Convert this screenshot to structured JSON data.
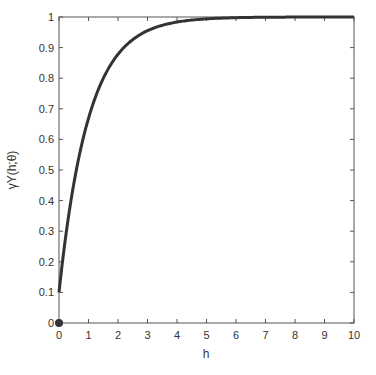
{
  "chart_data": {
    "type": "line",
    "title": "",
    "xlabel": "h",
    "ylabel": "γY(h;θ)",
    "xlim": [
      0,
      10
    ],
    "ylim": [
      0,
      1
    ],
    "grid": false,
    "legend": null,
    "x_ticks": [
      "0",
      "1",
      "2",
      "3",
      "4",
      "5",
      "6",
      "7",
      "8",
      "9",
      "10"
    ],
    "y_ticks": [
      "0",
      "0.1",
      "0.2",
      "0.3",
      "0.4",
      "0.5",
      "0.6",
      "0.7",
      "0.8",
      "0.9",
      "1"
    ],
    "series": [
      {
        "name": "exponential variogram with nugget",
        "color": "#333333",
        "x": [
          0,
          0.25,
          0.5,
          0.75,
          1,
          1.5,
          2,
          2.5,
          3,
          3.5,
          4,
          5,
          6,
          7,
          8,
          9,
          10
        ],
        "y": [
          0.1,
          0.3,
          0.45,
          0.58,
          0.67,
          0.8,
          0.88,
          0.93,
          0.955,
          0.973,
          0.984,
          0.994,
          0.998,
          0.999,
          1.0,
          1.0,
          1.0
        ]
      }
    ],
    "markers": [
      {
        "name": "origin point",
        "x": 0,
        "y": 0,
        "color": "#333333"
      }
    ]
  }
}
